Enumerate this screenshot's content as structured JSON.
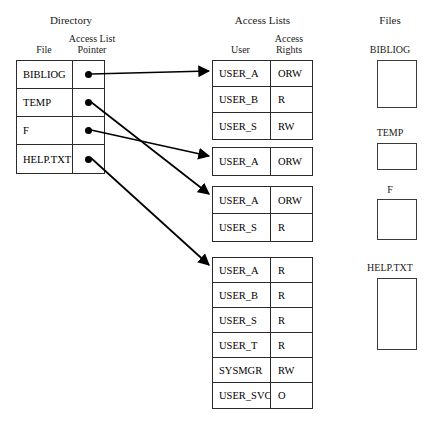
{
  "sections": {
    "directory": {
      "title": "Directory",
      "header_file": "File",
      "header_pointer_line1": "Access List",
      "header_pointer_line2": "Pointer",
      "rows": [
        {
          "file": "BIBLIOG",
          "pointer_icon": "bullet-pointer-icon"
        },
        {
          "file": "TEMP",
          "pointer_icon": "bullet-pointer-icon"
        },
        {
          "file": "F",
          "pointer_icon": "bullet-pointer-icon"
        },
        {
          "file": "HELP.TXT",
          "pointer_icon": "bullet-pointer-icon"
        }
      ]
    },
    "access_lists": {
      "title": "Access Lists",
      "header_user": "User",
      "header_rights_line1": "Access",
      "header_rights_line2": "Rights",
      "blocks": [
        {
          "rows": [
            {
              "user": "USER_A",
              "rights": "ORW"
            },
            {
              "user": "USER_B",
              "rights": "R"
            },
            {
              "user": "USER_S",
              "rights": "RW"
            }
          ]
        },
        {
          "rows": [
            {
              "user": "USER_A",
              "rights": "ORW"
            }
          ]
        },
        {
          "rows": [
            {
              "user": "USER_A",
              "rights": "ORW"
            },
            {
              "user": "USER_S",
              "rights": "R"
            }
          ]
        },
        {
          "rows": [
            {
              "user": "USER_A",
              "rights": "R"
            },
            {
              "user": "USER_B",
              "rights": "R"
            },
            {
              "user": "USER_S",
              "rights": "R"
            },
            {
              "user": "USER_T",
              "rights": "R"
            },
            {
              "user": "SYSMGR",
              "rights": "RW"
            },
            {
              "user": "USER_SVCS",
              "rights": "O"
            }
          ]
        }
      ]
    },
    "files": {
      "title": "Files",
      "items": [
        {
          "label": "BIBLIOG"
        },
        {
          "label": "TEMP"
        },
        {
          "label": "F"
        },
        {
          "label": "HELP.TXT"
        }
      ]
    }
  },
  "colors": {
    "stroke": "#2b2b2b",
    "text": "#1a1a1a",
    "background": "#ffffff"
  }
}
